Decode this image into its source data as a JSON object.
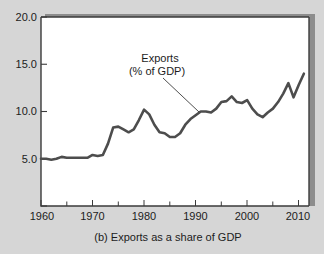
{
  "caption": "(b) Exports as a share of GDP",
  "colors": {
    "background": "#d6d6d6",
    "plot_background": "#ffffff",
    "line": "#4d4d4d",
    "axis": "#3b3b3b",
    "text": "#1c1c1c",
    "shadow": "#8d8d8d"
  },
  "annotation": {
    "line1": "Exports",
    "line2": "(% of GDP)"
  },
  "axes": {
    "y_ticks": [
      "5.0",
      "10.0",
      "15.0",
      "20.0"
    ],
    "x_ticks": [
      "1960",
      "1970",
      "1980",
      "1990",
      "2000",
      "2010"
    ]
  },
  "chart_data": {
    "type": "line",
    "title": "(b) Exports as a share of GDP",
    "xlabel": "",
    "ylabel": "",
    "legend": [
      "Exports (% of GDP)"
    ],
    "grid": false,
    "xlim": [
      1960,
      2012
    ],
    "ylim": [
      0,
      20
    ],
    "yticks": [
      5.0,
      10.0,
      15.0,
      20.0
    ],
    "ytick_labels": [
      "5.0",
      "10.0",
      "15.0",
      "20.0"
    ],
    "xticks": [
      1960,
      1970,
      1980,
      1990,
      2000,
      2010
    ],
    "xtick_labels": [
      "1960",
      "1970",
      "1980",
      "1990",
      "2000",
      "2010"
    ],
    "x_minor_tick_step": 5,
    "annotations": [
      {
        "text": "Exports (% of GDP)",
        "points_to_x": 1991,
        "points_to_y": 10.0
      }
    ],
    "series": [
      {
        "name": "Exports (% of GDP)",
        "x": [
          1960,
          1961,
          1962,
          1963,
          1964,
          1965,
          1966,
          1967,
          1968,
          1969,
          1970,
          1971,
          1972,
          1973,
          1974,
          1975,
          1976,
          1977,
          1978,
          1979,
          1980,
          1981,
          1982,
          1983,
          1984,
          1985,
          1986,
          1987,
          1988,
          1989,
          1990,
          1991,
          1992,
          1993,
          1994,
          1995,
          1996,
          1997,
          1998,
          1999,
          2000,
          2001,
          2002,
          2003,
          2004,
          2005,
          2006,
          2007,
          2008,
          2009,
          2010,
          2011
        ],
        "values": [
          5.0,
          5.0,
          4.9,
          5.0,
          5.2,
          5.1,
          5.1,
          5.1,
          5.1,
          5.1,
          5.4,
          5.3,
          5.4,
          6.6,
          8.3,
          8.4,
          8.1,
          7.8,
          8.1,
          9.1,
          10.2,
          9.7,
          8.6,
          7.8,
          7.7,
          7.3,
          7.3,
          7.7,
          8.6,
          9.2,
          9.6,
          10.0,
          10.0,
          9.9,
          10.3,
          11.0,
          11.1,
          11.6,
          11.0,
          10.9,
          11.2,
          10.3,
          9.7,
          9.4,
          9.9,
          10.3,
          11.0,
          11.9,
          13.0,
          11.5,
          12.8,
          14.0
        ]
      }
    ]
  }
}
